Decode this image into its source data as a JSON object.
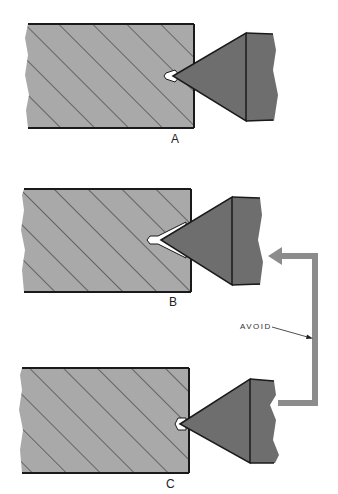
{
  "figure": {
    "panels": [
      {
        "id": "A",
        "label": "A",
        "description": "correct centering: drill point touches center hole lightly"
      },
      {
        "id": "B",
        "label": "B",
        "description": "center hole too deep"
      },
      {
        "id": "C",
        "label": "C",
        "description": "center hole correct"
      }
    ],
    "callout": {
      "text": "AVOID"
    },
    "colors": {
      "workpiece": "#a9a9a9",
      "hatch": "#2a2a2a",
      "tool": "#6e6e6e",
      "arrow": "#8c8c8c",
      "outline": "#1a1a1a"
    }
  }
}
